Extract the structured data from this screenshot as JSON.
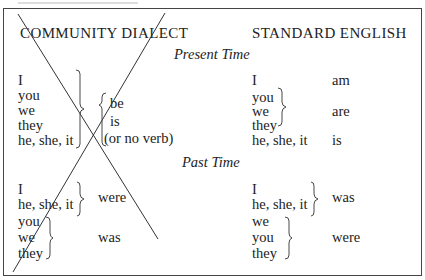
{
  "table": {
    "headers": {
      "left": "COMMUNITY DIALECT",
      "right": "STANDARD ENGLISH"
    },
    "sections": [
      {
        "title": "Present Time",
        "community": {
          "pronouns": [
            "I",
            "you",
            "we",
            "they",
            "he, she, it"
          ],
          "verbs": [
            "be",
            "is",
            "(or no verb)"
          ]
        },
        "standard": [
          {
            "pronouns": [
              "I"
            ],
            "verb": "am"
          },
          {
            "pronouns": [
              "you",
              "we",
              "they"
            ],
            "verb": "are"
          },
          {
            "pronouns": [
              "he, she, it"
            ],
            "verb": "is"
          }
        ]
      },
      {
        "title": "Past Time",
        "community": [
          {
            "pronouns": [
              "I",
              "he, she, it"
            ],
            "verb": "were"
          },
          {
            "pronouns": [
              "you",
              "we",
              "they"
            ],
            "verb": "was"
          }
        ],
        "standard": [
          {
            "pronouns": [
              "I",
              "he, she, it"
            ],
            "verb": "was"
          },
          {
            "pronouns": [
              "we",
              "you",
              "they"
            ],
            "verb": "were"
          }
        ]
      }
    ],
    "annotation": "community-dialect-column-crossed-out"
  }
}
